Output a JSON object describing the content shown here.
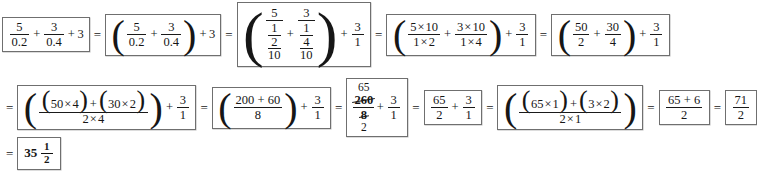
{
  "document": {
    "type": "math-worksheet-solution",
    "description": "Step-by-step simplification of 5/0.2 + 3/0.4 + 3",
    "final_answer": "35 1/2"
  },
  "symbols": {
    "equals": "=",
    "plus": "+",
    "times": "×",
    "paren_open": "(",
    "paren_close": ")"
  },
  "steps": {
    "s1": {
      "label": "original-expression",
      "n1": "5",
      "d1": "0.2",
      "n2": "3",
      "d2": "0.4",
      "addend": "3"
    },
    "s2": {
      "label": "grouped-expression",
      "n1": "5",
      "d1": "0.2",
      "n2": "3",
      "d2": "0.4",
      "addend": "3"
    },
    "s3": {
      "label": "decimals-as-fractions",
      "n1": "5",
      "d1_num": "1",
      "d1_den": "2",
      "d1_sub": "10",
      "n2": "3",
      "d2_num": "1",
      "d2_den": "4",
      "d2_sub": "10",
      "tail_num": "3",
      "tail_den": "1"
    },
    "s4": {
      "label": "multiply-by-reciprocal",
      "t1_num_a": "5",
      "t1_num_b": "10",
      "t1_den_a": "1",
      "t1_den_b": "2",
      "t2_num_a": "3",
      "t2_num_b": "10",
      "t2_den_a": "1",
      "t2_den_b": "4",
      "tail_num": "3",
      "tail_den": "1"
    },
    "s5": {
      "label": "products-simplified",
      "n1": "50",
      "d1": "2",
      "n2": "30",
      "d2": "4",
      "tail_num": "3",
      "tail_den": "1"
    },
    "s6": {
      "label": "common-denominator-expansion",
      "a1": "50",
      "a2": "4",
      "b1": "30",
      "b2": "2",
      "den_a": "2",
      "den_b": "4",
      "tail_num": "3",
      "tail_den": "1"
    },
    "s7": {
      "label": "numerator-products",
      "num": "200 + 60",
      "den": "8",
      "tail_num": "3",
      "tail_den": "1"
    },
    "s8": {
      "label": "cancellation",
      "num_cancel": "65",
      "num_original": "260",
      "den_original": "8",
      "den_cancel": "2",
      "tail_num": "3",
      "tail_den": "1"
    },
    "s9": {
      "label": "reduced-fraction-sum",
      "n1": "65",
      "d1": "2",
      "n2": "3",
      "d2": "1"
    },
    "s10": {
      "label": "cross-multiply-expansion",
      "a1": "65",
      "a2": "1",
      "b1": "3",
      "b2": "2",
      "den_a": "2",
      "den_b": "1"
    },
    "s11": {
      "label": "numerator-sum",
      "num": "65 + 6",
      "den": "2"
    },
    "s12": {
      "label": "improper-fraction",
      "num": "71",
      "den": "2"
    },
    "s13": {
      "label": "final-mixed-number",
      "whole": "35",
      "num": "1",
      "den": "2"
    }
  }
}
